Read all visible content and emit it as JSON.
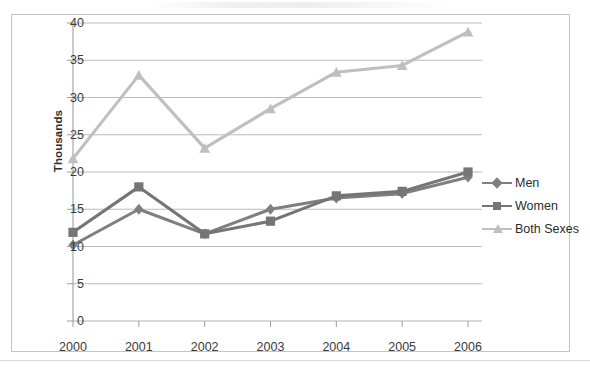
{
  "chart_data": {
    "type": "line",
    "title": "",
    "xlabel": "",
    "ylabel": "Thousands",
    "categories": [
      "2000",
      "2001",
      "2002",
      "2003",
      "2004",
      "2005",
      "2006"
    ],
    "ylim": [
      0,
      40
    ],
    "ytick_step": 5,
    "yticks": [
      "0",
      "5",
      "10",
      "15",
      "20",
      "25",
      "30",
      "35",
      "40"
    ],
    "grid": "horizontal",
    "legend_position": "right",
    "series": [
      {
        "name": "Men",
        "color": "#7f7f7f",
        "marker": "diamond",
        "values": [
          10.2,
          15.0,
          11.7,
          15.0,
          16.5,
          17.1,
          19.3
        ]
      },
      {
        "name": "Women",
        "color": "#757575",
        "marker": "square",
        "values": [
          11.9,
          18.0,
          11.7,
          13.4,
          16.8,
          17.4,
          20.0
        ]
      },
      {
        "name": "Both Sexes",
        "color": "#bfbfbf",
        "marker": "triangle",
        "values": [
          21.8,
          33.0,
          23.2,
          28.5,
          33.4,
          34.3,
          38.8
        ]
      }
    ]
  },
  "axis": {
    "y_title": "Thousands"
  },
  "legend": {
    "items": [
      {
        "label": "Men"
      },
      {
        "label": "Women"
      },
      {
        "label": "Both Sexes"
      }
    ]
  },
  "colors": {
    "men": "#7f7f7f",
    "women": "#757575",
    "both_sexes": "#bfbfbf",
    "gridline": "#b3b3b3",
    "axis": "#9e9e9e",
    "frame": "#c4c4c4",
    "text": "#3a3a3a"
  }
}
